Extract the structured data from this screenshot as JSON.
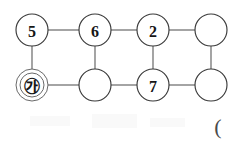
{
  "canvas": {
    "width": 240,
    "height": 143,
    "background_color": "#ffffff"
  },
  "style": {
    "node_fill": "#ffffff",
    "node_stroke": "#3a3a3a",
    "edge_stroke": "#5a5a5a",
    "label_color": "#161616",
    "node_radius": 16,
    "double_ring_outer_radius": 16,
    "double_ring_inner_radius": 12
  },
  "diagram": {
    "type": "grid-graph",
    "rows": 2,
    "columns": 4,
    "nodes": [
      {
        "id": "r1c1",
        "label": "5",
        "row": 1,
        "column": 1,
        "cx": 32,
        "cy": 30,
        "r": 16,
        "double_ring": false,
        "empty": false
      },
      {
        "id": "r1c2",
        "label": "6",
        "row": 1,
        "column": 2,
        "cx": 95,
        "cy": 30,
        "r": 16,
        "double_ring": false,
        "empty": false
      },
      {
        "id": "r1c3",
        "label": "2",
        "row": 1,
        "column": 3,
        "cx": 153,
        "cy": 30,
        "r": 16,
        "double_ring": false,
        "empty": false
      },
      {
        "id": "r1c4",
        "label": "",
        "row": 1,
        "column": 4,
        "cx": 211,
        "cy": 30,
        "r": 16,
        "double_ring": false,
        "empty": true
      },
      {
        "id": "r2c1",
        "label": "㉮",
        "row": 2,
        "column": 1,
        "cx": 32,
        "cy": 85,
        "r": 16,
        "double_ring": true,
        "empty": false
      },
      {
        "id": "r2c2",
        "label": "",
        "row": 2,
        "column": 2,
        "cx": 95,
        "cy": 85,
        "r": 16,
        "double_ring": false,
        "empty": true
      },
      {
        "id": "r2c3",
        "label": "7",
        "row": 2,
        "column": 3,
        "cx": 153,
        "cy": 85,
        "r": 16,
        "double_ring": false,
        "empty": false
      },
      {
        "id": "r2c4",
        "label": "",
        "row": 2,
        "column": 4,
        "cx": 211,
        "cy": 85,
        "r": 16,
        "double_ring": false,
        "empty": true
      }
    ],
    "edges": [
      {
        "id": "e-r1c1-r1c2",
        "from": "r1c1",
        "to": "r1c2",
        "orientation": "horizontal",
        "x1": 48,
        "y1": 30,
        "x2": 79,
        "y2": 30
      },
      {
        "id": "e-r1c2-r1c3",
        "from": "r1c2",
        "to": "r1c3",
        "orientation": "horizontal",
        "x1": 111,
        "y1": 30,
        "x2": 137,
        "y2": 30
      },
      {
        "id": "e-r1c3-r1c4",
        "from": "r1c3",
        "to": "r1c4",
        "orientation": "horizontal",
        "x1": 169,
        "y1": 30,
        "x2": 195,
        "y2": 30
      },
      {
        "id": "e-r2c1-r2c2",
        "from": "r2c1",
        "to": "r2c2",
        "orientation": "horizontal",
        "x1": 48,
        "y1": 85,
        "x2": 79,
        "y2": 85
      },
      {
        "id": "e-r2c2-r2c3",
        "from": "r2c2",
        "to": "r2c3",
        "orientation": "horizontal",
        "x1": 111,
        "y1": 85,
        "x2": 137,
        "y2": 85
      },
      {
        "id": "e-r2c3-r2c4",
        "from": "r2c3",
        "to": "r2c4",
        "orientation": "horizontal",
        "x1": 169,
        "y1": 85,
        "x2": 195,
        "y2": 85
      },
      {
        "id": "e-r1c1-r2c1",
        "from": "r1c1",
        "to": "r2c1",
        "orientation": "vertical",
        "x1": 32,
        "y1": 46,
        "x2": 32,
        "y2": 69
      },
      {
        "id": "e-r1c2-r2c2",
        "from": "r1c2",
        "to": "r2c2",
        "orientation": "vertical",
        "x1": 95,
        "y1": 46,
        "x2": 95,
        "y2": 69
      },
      {
        "id": "e-r1c3-r2c3",
        "from": "r1c3",
        "to": "r2c3",
        "orientation": "vertical",
        "x1": 153,
        "y1": 46,
        "x2": 153,
        "y2": 69
      },
      {
        "id": "e-r1c4-r2c4",
        "from": "r1c4",
        "to": "r2c4",
        "orientation": "vertical",
        "x1": 211,
        "y1": 46,
        "x2": 211,
        "y2": 69
      }
    ]
  },
  "annotations": {
    "bottom_right_mark": {
      "text": "(",
      "x": 218,
      "y": 126
    }
  }
}
